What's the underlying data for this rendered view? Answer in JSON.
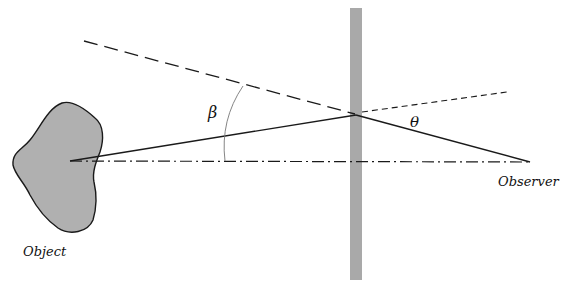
{
  "diagram": {
    "labels": {
      "object": "Object",
      "observer": "Observer",
      "beta": "β",
      "theta": "θ"
    },
    "colors": {
      "plate": "#a9a9a9",
      "object_fill": "#b0b0b0",
      "line": "#1a1a1a",
      "angle_arc": "#777777"
    }
  }
}
